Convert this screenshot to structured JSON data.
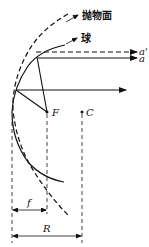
{
  "diagram": {
    "labels": {
      "paraboloid": "抛物面",
      "sphere": "球",
      "ray_dashed": "a'",
      "ray_solid": "a",
      "focus": "F",
      "center": "C",
      "focal_length": "f",
      "radius": "R"
    },
    "colors": {
      "stroke": "#111111",
      "background": "#ffffff"
    }
  }
}
